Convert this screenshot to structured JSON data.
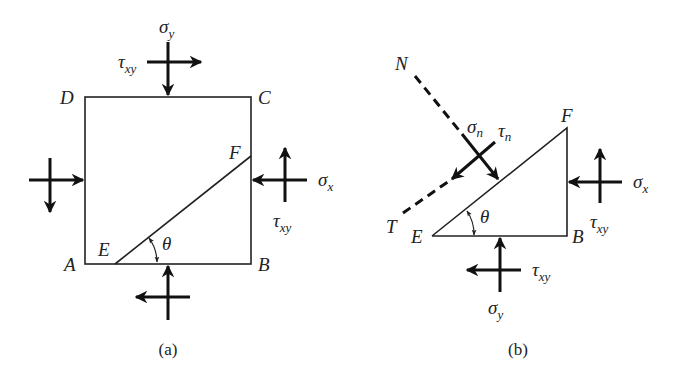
{
  "figure": {
    "panel_a": {
      "caption": "(a)",
      "vertices": {
        "A": "A",
        "B": "B",
        "C": "C",
        "D": "D",
        "E": "E",
        "F": "F"
      },
      "angle": "θ",
      "labels": {
        "sigma_y": {
          "base": "σ",
          "sub": "y"
        },
        "tau_xy_top": {
          "base": "τ",
          "sub": "xy"
        },
        "sigma_x": {
          "base": "σ",
          "sub": "x"
        },
        "tau_xy_right": {
          "base": "τ",
          "sub": "xy"
        }
      }
    },
    "panel_b": {
      "caption": "(b)",
      "vertices": {
        "N": "N",
        "T": "T",
        "E": "E",
        "F": "F",
        "B": "B"
      },
      "angle": "θ",
      "labels": {
        "sigma_n": {
          "base": "σ",
          "sub": "n"
        },
        "tau_n": {
          "base": "τ",
          "sub": "n"
        },
        "sigma_x": {
          "base": "σ",
          "sub": "x"
        },
        "tau_xy_right": {
          "base": "τ",
          "sub": "xy"
        },
        "tau_xy_bottom": {
          "base": "τ",
          "sub": "xy"
        },
        "sigma_y": {
          "base": "σ",
          "sub": "y"
        }
      }
    }
  }
}
